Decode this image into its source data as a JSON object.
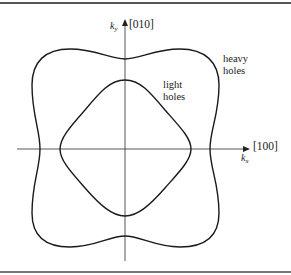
{
  "diagram": {
    "axes": {
      "x": {
        "variable": "k",
        "subscript": "x",
        "direction_label": "[100]"
      },
      "y": {
        "variable": "k",
        "subscript": "y",
        "direction_label": "[010]"
      }
    },
    "curves": [
      {
        "id": "heavy-holes",
        "label_line1": "heavy",
        "label_line2": "holes",
        "shape": "warped square (four-lobed constant-energy contour)"
      },
      {
        "id": "light-holes",
        "label_line1": "light",
        "label_line2": "holes",
        "shape": "rounded diamond (constant-energy contour)"
      }
    ],
    "colors": {
      "curve": "#1a1a1a",
      "axis": "#444444",
      "rule": "#555555",
      "background": "#ffffff"
    }
  }
}
